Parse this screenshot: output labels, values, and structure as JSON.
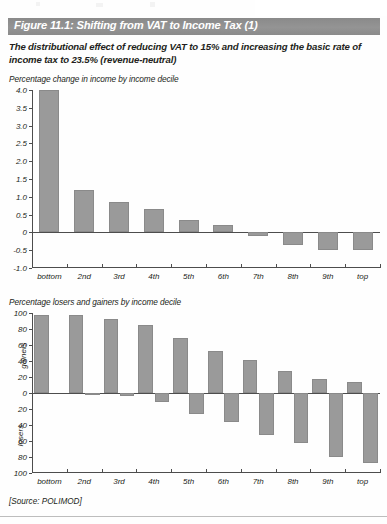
{
  "figure": {
    "title": "Figure 11.1: Shifting from VAT to Income Tax (1)",
    "subtitle": "The distributional effect of reducing VAT to 15% and increasing the basic rate of income tax to 23.5% (revenue-neutral)",
    "source": "[Source: POLIMOD]",
    "title_band_color": "#8d8d8d",
    "bar_color": "#9a9a9a",
    "axis_color": "#4d4d4d"
  },
  "chart_data": [
    {
      "type": "bar",
      "title": "Percentage change in income by income decile",
      "xlabel": "",
      "ylabel": "",
      "categories": [
        "bottom",
        "2nd",
        "3rd",
        "4th",
        "5th",
        "6th",
        "7th",
        "8th",
        "9th",
        "top"
      ],
      "values": [
        4.0,
        1.2,
        0.85,
        0.65,
        0.35,
        0.2,
        -0.1,
        -0.35,
        -0.5,
        -0.5
      ],
      "ylim": [
        -1.0,
        4.0
      ],
      "yticks": [
        "4.0",
        "3.5",
        "3.0",
        "2.5",
        "2.0",
        "1.5",
        "1.0",
        "0.5",
        "0",
        "-0.5",
        "-1.0"
      ],
      "ytick_values": [
        4.0,
        3.5,
        3.0,
        2.5,
        2.0,
        1.5,
        1.0,
        0.5,
        0,
        -0.5,
        -1.0
      ],
      "grid": false,
      "legend": "none"
    },
    {
      "type": "bar",
      "title": "Percentage losers and gainers by income decile",
      "xlabel": "",
      "ylabel": "",
      "axis_side_labels": [
        "gainers",
        "losers"
      ],
      "categories": [
        "bottom",
        "2nd",
        "3rd",
        "4th",
        "5th",
        "6th",
        "7th",
        "8th",
        "9th",
        "top"
      ],
      "series": [
        {
          "name": "gainers",
          "values": [
            97,
            97,
            93,
            85,
            69,
            53,
            41,
            28,
            18,
            14
          ]
        },
        {
          "name": "losers",
          "values": [
            0,
            -1,
            -4,
            -11,
            -26,
            -36,
            -52,
            -62,
            -80,
            -88
          ]
        }
      ],
      "ylim": [
        -100,
        100
      ],
      "yticks": [
        "100",
        "80",
        "60",
        "40",
        "20",
        "0",
        "20",
        "40",
        "60",
        "80",
        "100"
      ],
      "ytick_values": [
        100,
        80,
        60,
        40,
        20,
        0,
        -20,
        -40,
        -60,
        -80,
        -100
      ],
      "grid": false,
      "legend": "none"
    }
  ]
}
